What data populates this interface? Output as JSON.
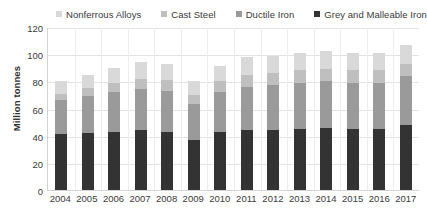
{
  "chart_data": {
    "type": "bar",
    "subtype": "stacked-bar",
    "title": "",
    "xlabel": "",
    "ylabel": "Million tonnes",
    "ylim": [
      0,
      120
    ],
    "ytick_step": 20,
    "yticks": [
      120,
      100,
      80,
      60,
      40,
      20,
      0
    ],
    "grid": true,
    "legend_position": "top",
    "categories": [
      "2004",
      "2005",
      "2006",
      "2007",
      "2008",
      "2009",
      "2010",
      "2011",
      "2012",
      "2013",
      "2014",
      "2015",
      "2016",
      "2017"
    ],
    "series": [
      {
        "name": "Grey and Malleable Iron",
        "color": "#333333",
        "values": [
          41,
          42,
          43,
          44,
          43,
          37,
          43,
          44,
          44,
          45,
          46,
          45,
          45,
          48
        ]
      },
      {
        "name": "Ductile Iron",
        "color": "#9a9a9a",
        "values": [
          25,
          27,
          29,
          30,
          30,
          26,
          29,
          32,
          33,
          34,
          34,
          34,
          34,
          36
        ]
      },
      {
        "name": "Cast Steel",
        "color": "#bfbfbf",
        "values": [
          5,
          6,
          7,
          8,
          8,
          7,
          8,
          9,
          9,
          9,
          9,
          9,
          9,
          9
        ]
      },
      {
        "name": "Nonferrous Alloys",
        "color": "#d9d9d9",
        "values": [
          9,
          10,
          11,
          12,
          12,
          10,
          11,
          13,
          13,
          13,
          13,
          13,
          13,
          14
        ]
      }
    ],
    "totals": [
      80,
      85,
      90,
      94,
      93,
      80,
      91,
      98,
      99,
      101,
      102,
      101,
      101,
      107
    ]
  },
  "legend": {
    "items": [
      {
        "label": "Nonferrous Alloys",
        "color": "#d9d9d9"
      },
      {
        "label": "Cast Steel",
        "color": "#bfbfbf"
      },
      {
        "label": "Ductile Iron",
        "color": "#9a9a9a"
      },
      {
        "label": "Grey and Malleable Iron",
        "color": "#333333"
      }
    ]
  },
  "axis": {
    "y_title": "Million tonnes"
  }
}
